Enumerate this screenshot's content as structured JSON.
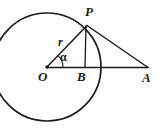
{
  "figure": {
    "background_color": "#ffffff",
    "stroke_color": "#1a1a1a",
    "width": 160,
    "height": 128,
    "circle": {
      "center": {
        "x": 47,
        "y": 67
      },
      "radius": 54,
      "center_point_name": "O"
    },
    "points": [
      {
        "name": "O",
        "label": "O",
        "x": 47,
        "y": 67,
        "role": "circle-center"
      },
      {
        "name": "P",
        "label": "P",
        "x": 87,
        "y": 25,
        "role": "point-on-circle"
      },
      {
        "name": "B",
        "label": "B",
        "x": 85,
        "y": 68,
        "role": "foot-of-perpendicular"
      },
      {
        "name": "A",
        "label": "A",
        "x": 148,
        "y": 68,
        "role": "external-point"
      }
    ],
    "segments": [
      {
        "name": "OP",
        "from": "O",
        "to": "P",
        "label": "r",
        "meaning": "radius"
      },
      {
        "name": "OA",
        "from": "O",
        "to": "A",
        "label": "",
        "meaning": "baseline through center"
      },
      {
        "name": "PA",
        "from": "P",
        "to": "A",
        "label": "",
        "meaning": "tangent line"
      },
      {
        "name": "PB",
        "from": "P",
        "to": "B",
        "label": "",
        "meaning": "perpendicular height"
      }
    ],
    "angles": [
      {
        "name": "alpha",
        "label": "α",
        "vertex": "O",
        "between": [
          "OB",
          "OP"
        ]
      }
    ],
    "labels": {
      "P": "P",
      "O": "O",
      "B": "B",
      "A": "A",
      "radius": "r",
      "alpha": "α"
    }
  }
}
